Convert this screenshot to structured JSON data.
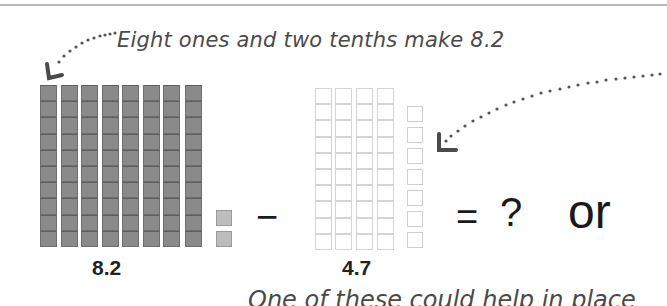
{
  "captions": {
    "top": "Eight ones and two tenths make 8.2",
    "bottom": "One of these could help in place"
  },
  "left_group": {
    "label": "8.2",
    "ones": 8,
    "tenths": 2,
    "fill": "#8a8a8a",
    "tenth_fill": "#bdbdbd"
  },
  "right_group": {
    "label": "4.7",
    "ones": 4,
    "tenths": 7,
    "fill": "#ffffff"
  },
  "operators": {
    "minus": "−",
    "equals": "=",
    "question": "?",
    "or": "or"
  },
  "icons": {
    "left_arrow": "dotted-arrow-down-left",
    "right_arrow": "dotted-arrow-down-left"
  },
  "colors": {
    "dark_block": "#8a8a8a",
    "light_block_border": "#d4d4d4",
    "text": "#222222",
    "caption": "#4a4a4a",
    "rule": "#b9b9b9"
  }
}
